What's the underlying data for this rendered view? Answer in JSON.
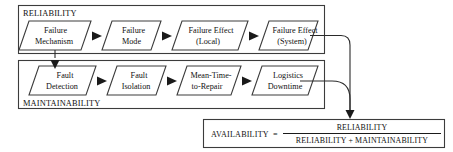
{
  "diagram": {
    "title_hidden": "Reliability and Maintainability to Availability flow",
    "colors": {
      "background": "#ffffff",
      "line": "#3c3c3c",
      "arrow": "#1a1a1a",
      "text": "#111111",
      "node_fill": "#ffffff"
    },
    "groups": [
      {
        "id": "reliability",
        "label": "RELIABILITY",
        "label_position": "top-left"
      },
      {
        "id": "maintainability",
        "label": "MAINTAINABILITY",
        "label_position": "bottom-left"
      }
    ],
    "reliability_nodes": [
      {
        "id": "failure-mechanism",
        "line1": "Failure",
        "line2": "Mechanism"
      },
      {
        "id": "failure-mode",
        "line1": "Failure",
        "line2": "Mode"
      },
      {
        "id": "failure-effect-local",
        "line1": "Failure Effect",
        "line2": "(Local)"
      },
      {
        "id": "failure-effect-system",
        "line1": "Failure Effect",
        "line2": "(System)"
      }
    ],
    "maintainability_nodes": [
      {
        "id": "fault-detection",
        "line1": "Fault",
        "line2": "Detection"
      },
      {
        "id": "fault-isolation",
        "line1": "Fault",
        "line2": "Isolation"
      },
      {
        "id": "mean-time-to-repair",
        "line1": "Mean-Time-",
        "line2": "to-Repair"
      },
      {
        "id": "logistics-downtime",
        "line1": "Logistics",
        "line2": "Downtime"
      }
    ],
    "formula": {
      "left_term": "AVAILABILITY",
      "equals": "=",
      "numerator": "RELIABILITY",
      "denominator": "RELIABILITY + MAINTAINABILITY"
    }
  }
}
